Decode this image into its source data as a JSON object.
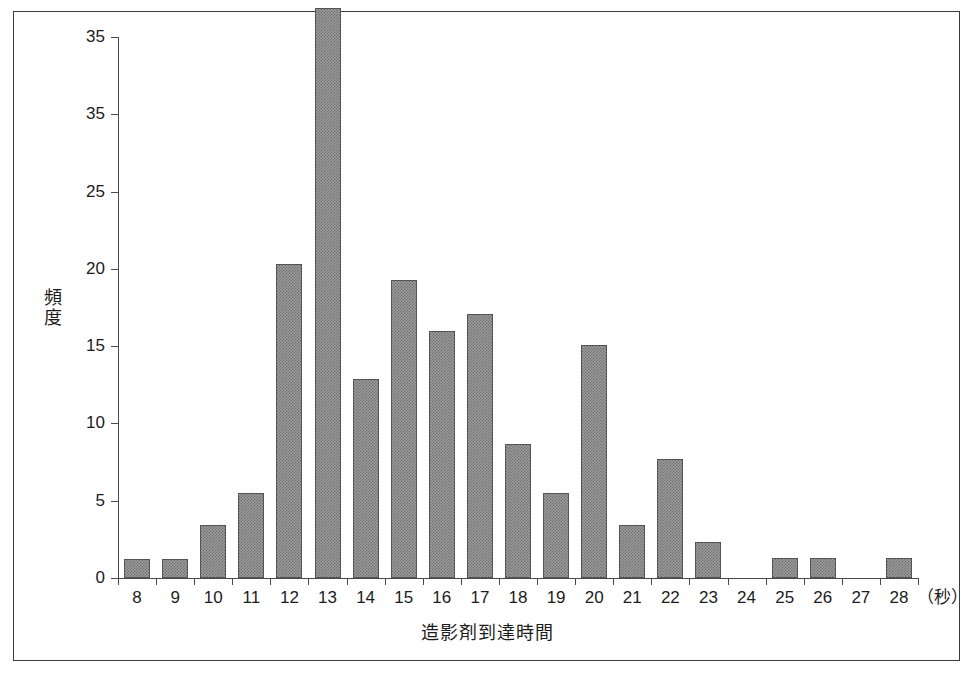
{
  "chart_data": {
    "type": "bar",
    "title": "",
    "xlabel": "造影剤到達時間",
    "ylabel": "頻度",
    "x_unit_label": "（秒）",
    "categories": [
      "8",
      "9",
      "10",
      "11",
      "12",
      "13",
      "14",
      "15",
      "16",
      "17",
      "18",
      "19",
      "20",
      "21",
      "22",
      "23",
      "24",
      "25",
      "26",
      "27",
      "28"
    ],
    "values": [
      1.2,
      1.2,
      3.4,
      5.5,
      20.3,
      36.9,
      12.9,
      19.3,
      16.0,
      17.1,
      8.7,
      5.5,
      15.1,
      3.4,
      7.7,
      2.3,
      0,
      1.3,
      1.3,
      0,
      1.3
    ],
    "ylim": [
      0,
      35
    ],
    "ytick_labels": [
      "35",
      "35",
      "25",
      "20",
      "15",
      "10",
      "5",
      "0"
    ],
    "ytick_values": [
      35,
      30,
      25,
      20,
      15,
      10,
      5,
      0
    ],
    "grid": false,
    "legend": "none",
    "bar_color": "#9a9a9a",
    "bar_edge_color": "#545454",
    "axis_color": "#4a4a4a",
    "frame_color": "#3a3a3a",
    "background": "#ffffff"
  }
}
